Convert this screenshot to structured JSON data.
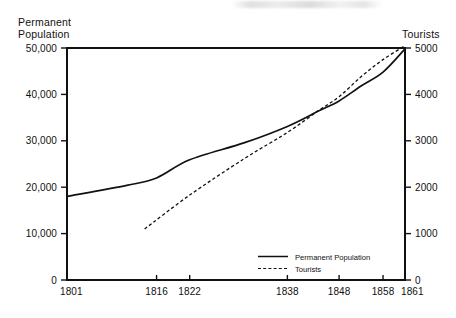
{
  "chart_data": {
    "type": "line",
    "title": "",
    "subtitle": "",
    "xlabel": "",
    "ylabel": "Permanent Population",
    "y2label": "Tourists",
    "grid": false,
    "legend_position": "inside-bottom-right",
    "x_tick_labels": [
      "1801",
      "1816",
      "1822",
      "1838",
      "1848",
      "1858",
      "1861"
    ],
    "x_tick_values": [
      1801,
      1816,
      1822,
      1838,
      1848,
      1858,
      1861
    ],
    "xlim": [
      1801,
      1861
    ],
    "ylim": [
      0,
      50000
    ],
    "y_tick_labels": [
      "0",
      "10,000",
      "20,000",
      "30,000",
      "40,000",
      "50,000"
    ],
    "y_tick_values": [
      0,
      10000,
      20000,
      30000,
      40000,
      50000
    ],
    "y2lim": [
      0,
      5000
    ],
    "y2_tick_labels": [
      "0",
      "1000",
      "2000",
      "3000",
      "4000",
      "5000"
    ],
    "y2_tick_values": [
      0,
      1000,
      2000,
      3000,
      4000,
      5000
    ],
    "series": [
      {
        "name": "Permanent Population",
        "style": "solid",
        "axis": "left",
        "color": "#111111",
        "x": [
          1801,
          1811,
          1816,
          1822,
          1831,
          1838,
          1844,
          1848,
          1853,
          1858,
          1861
        ],
        "values": [
          18000,
          20400,
          22000,
          25900,
          29600,
          33100,
          36400,
          38600,
          41800,
          44800,
          49800
        ]
      },
      {
        "name": "Tourists",
        "style": "dashed",
        "axis": "right",
        "color": "#111111",
        "x": [
          1814,
          1822,
          1831,
          1838,
          1844,
          1848,
          1853,
          1858,
          1861
        ],
        "values": [
          1100,
          1830,
          2620,
          3180,
          3650,
          3950,
          4380,
          4750,
          5050
        ]
      }
    ],
    "annotations": []
  },
  "legend": {
    "entries": [
      {
        "label": "Permanent Population",
        "style": "solid"
      },
      {
        "label": "Tourists",
        "style": "dashed"
      }
    ]
  },
  "labels": {
    "y_axis_title_line1": "Permanent",
    "y_axis_title_line2": "Population",
    "y2_axis_title": "Tourists"
  }
}
